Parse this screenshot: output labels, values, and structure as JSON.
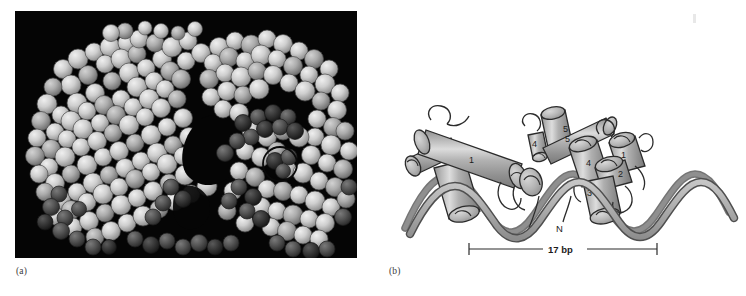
{
  "figure": {
    "kind": "two-panel-scientific-figure",
    "background_color": "#ffffff"
  },
  "panels": [
    {
      "id": "a",
      "label": "(a)",
      "type": "space-filling-molecular-model",
      "background_color": "#050505",
      "rendering": "grayscale CPK spheres, light gray protein surface with dark gray highlighted residues",
      "annotation": {
        "name": "highlight-circle",
        "shape": "circle",
        "stroke_color": "#0a0a0a",
        "description": "thin black circle outlining a dark atom cluster on the right-hand lobe"
      },
      "colors": {
        "sphere_light": "#d8d8d8",
        "sphere_mid": "#9a9a9a",
        "sphere_dark": "#4a4a4a",
        "sphere_darkest": "#2a2a2a",
        "background": "#050505"
      }
    },
    {
      "id": "b",
      "label": "(b)",
      "type": "ribbon-and-cylinder-schematic",
      "background_color": "#ffffff",
      "colors": {
        "cylinder_fill": "#a9a9a9",
        "cylinder_highlight": "#d9d9d9",
        "cylinder_shadow": "#7c7c7c",
        "outline": "#2b2b2b",
        "dna_ribbon_front": "#b4b4b4",
        "dna_ribbon_back": "#8c8c8c",
        "dna_edge": "#4a4a4a"
      },
      "monomers": [
        {
          "name": "left-monomer",
          "helix_labels": [
            "1",
            "2",
            "3",
            "4",
            "5"
          ],
          "n_terminus_label": "N"
        },
        {
          "name": "right-monomer",
          "helix_labels": [
            "1",
            "2",
            "3",
            "4",
            "5"
          ],
          "n_terminus_label": "N"
        }
      ],
      "helix_label_values": [
        "1",
        "2",
        "3",
        "4",
        "5",
        "1",
        "2",
        "3",
        "4",
        "5"
      ],
      "n_terminus_labels": [
        "N",
        "N"
      ],
      "scale_bar": {
        "name": "dna-footprint-scale-bar",
        "label": "17 bp",
        "value": 17,
        "unit": "bp",
        "tick_style": "end-caps"
      },
      "dna": {
        "description": "two antiparallel gray ribbons forming a right-handed double helix running horizontally",
        "turns_visible": 5
      }
    }
  ]
}
